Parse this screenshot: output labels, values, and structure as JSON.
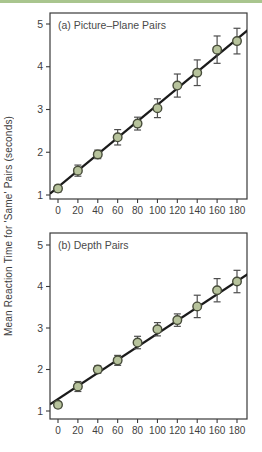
{
  "figure": {
    "y_axis_label": "Mean Reaction Time for 'Same' Pairs (seconds)",
    "top_bar_color": "#a9c58e",
    "background_color": "#ffffff"
  },
  "chart_data": [
    {
      "type": "scatter",
      "title": "(a) Picture–Plane Pairs",
      "xlabel": "",
      "ylabel": "Mean Reaction Time for 'Same' Pairs (seconds)",
      "x": [
        0,
        20,
        40,
        60,
        80,
        100,
        120,
        140,
        160,
        180
      ],
      "y": [
        1.15,
        1.57,
        1.95,
        2.35,
        2.67,
        3.03,
        3.56,
        3.86,
        4.4,
        4.6
      ],
      "y_err": [
        0.08,
        0.13,
        0.1,
        0.18,
        0.15,
        0.22,
        0.27,
        0.3,
        0.32,
        0.3
      ],
      "trend_line": {
        "x1": -8,
        "y1": 1.03,
        "x2": 191,
        "y2": 4.86
      },
      "xticks": [
        0,
        20,
        40,
        60,
        80,
        100,
        120,
        140,
        160,
        180
      ],
      "yticks": [
        1,
        2,
        3,
        4,
        5
      ],
      "xlim": [
        -8,
        191
      ],
      "ylim": [
        0.9,
        5.35
      ],
      "grid": false,
      "legend": null,
      "marker_fill": "#b7c39c",
      "marker_stroke": "#474c3a",
      "trend_color": "#1a1a1a",
      "error_color": "#4d4d4d",
      "axis_color": "#3a3a3a",
      "text_color": "#3f3f3f",
      "title_color": "#4a4a4a"
    },
    {
      "type": "scatter",
      "title": "(b) Depth Pairs",
      "xlabel": "",
      "ylabel": "Mean Reaction Time for 'Same' Pairs (seconds)",
      "x": [
        0,
        20,
        40,
        60,
        80,
        100,
        120,
        140,
        160,
        180
      ],
      "y": [
        1.15,
        1.59,
        2.0,
        2.22,
        2.65,
        2.97,
        3.19,
        3.52,
        3.91,
        4.12
      ],
      "y_err": [
        0.07,
        0.12,
        0.09,
        0.12,
        0.15,
        0.16,
        0.15,
        0.27,
        0.28,
        0.27
      ],
      "trend_line": {
        "x1": -8,
        "y1": 1.16,
        "x2": 191,
        "y2": 4.3
      },
      "xticks": [
        0,
        20,
        40,
        60,
        80,
        100,
        120,
        140,
        160,
        180
      ],
      "yticks": [
        1,
        2,
        3,
        4,
        5
      ],
      "xlim": [
        -8,
        191
      ],
      "ylim": [
        0.9,
        5.35
      ],
      "grid": false,
      "legend": null,
      "marker_fill": "#b7c39c",
      "marker_stroke": "#474c3a",
      "trend_color": "#1a1a1a",
      "error_color": "#4d4d4d",
      "axis_color": "#3a3a3a",
      "text_color": "#3f3f3f",
      "title_color": "#4a4a4a"
    }
  ]
}
